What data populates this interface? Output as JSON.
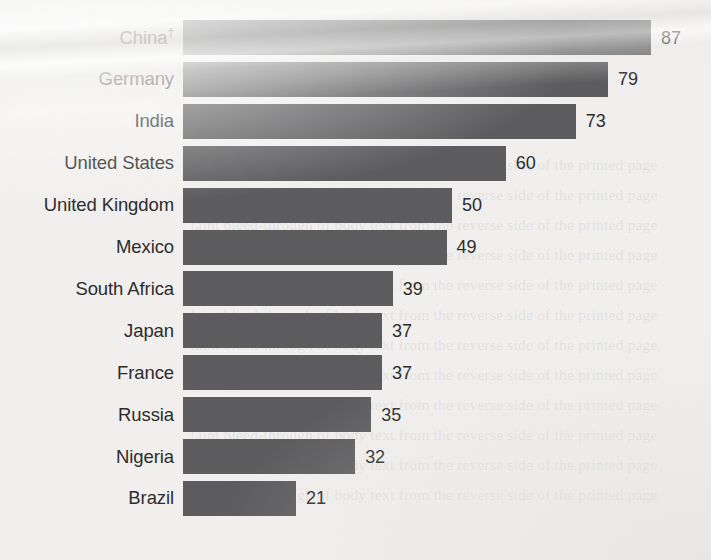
{
  "chart_data": {
    "type": "bar",
    "orientation": "horizontal",
    "title": "",
    "subtitle": "",
    "xlabel": "",
    "ylabel": "",
    "grid": false,
    "legend": null,
    "xlim": [
      0,
      87
    ],
    "value_label_position": "outside-end",
    "categories": [
      "China†",
      "Germany",
      "India",
      "United States",
      "United Kingdom",
      "Mexico",
      "South Africa",
      "Japan",
      "France",
      "Russia",
      "Nigeria",
      "Brazil"
    ],
    "values": [
      87,
      79,
      73,
      60,
      50,
      49,
      39,
      37,
      37,
      35,
      32,
      21
    ],
    "value_labels": [
      "87",
      "79",
      "73",
      "60",
      "50",
      "49",
      "39",
      "37",
      "37",
      "35",
      "32",
      "21"
    ],
    "footnote_marker": "†",
    "colors": {
      "bar": "#5c5c5e",
      "background": "#f1f0ee",
      "label_text": "#2b2b2b",
      "value_text": "#2b2b2b"
    }
  },
  "rows": [
    {
      "label": "China",
      "marker": "†",
      "value": 87,
      "value_label": "87"
    },
    {
      "label": "Germany",
      "marker": "",
      "value": 79,
      "value_label": "79"
    },
    {
      "label": "India",
      "marker": "",
      "value": 73,
      "value_label": "73"
    },
    {
      "label": "United States",
      "marker": "",
      "value": 60,
      "value_label": "60"
    },
    {
      "label": "United Kingdom",
      "marker": "",
      "value": 50,
      "value_label": "50"
    },
    {
      "label": "Mexico",
      "marker": "",
      "value": 49,
      "value_label": "49"
    },
    {
      "label": "South Africa",
      "marker": "",
      "value": 39,
      "value_label": "39"
    },
    {
      "label": "Japan",
      "marker": "",
      "value": 37,
      "value_label": "37"
    },
    {
      "label": "France",
      "marker": "",
      "value": 37,
      "value_label": "37"
    },
    {
      "label": "Russia",
      "marker": "",
      "value": 35,
      "value_label": "35"
    },
    {
      "label": "Nigeria",
      "marker": "",
      "value": 32,
      "value_label": "32"
    },
    {
      "label": "Brazil",
      "marker": "",
      "value": 21,
      "value_label": "21"
    }
  ],
  "layout": {
    "bar_origin_x": 183,
    "px_per_unit": 5.38,
    "first_bar_top": 20,
    "row_pitch": 41.9,
    "bar_height": 35,
    "label_gap": 9,
    "value_gap": 10
  },
  "page_ghost_text": "faint bleed-through of body text from the reverse side of the printed page"
}
